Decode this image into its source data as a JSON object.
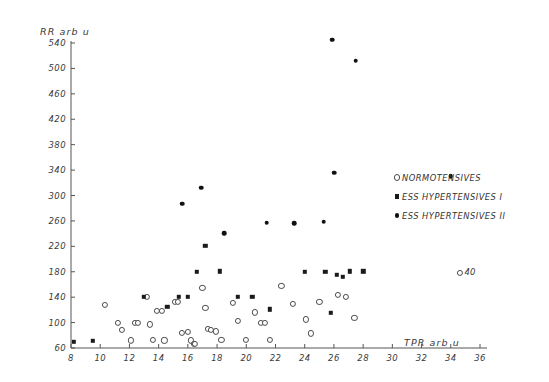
{
  "chart_data": {
    "type": "scatter",
    "title": "",
    "xlabel": "TPR arb u",
    "ylabel": "RR arb u",
    "xlim": [
      8,
      36
    ],
    "ylim": [
      60,
      540
    ],
    "xticks": [
      8,
      10,
      12,
      14,
      16,
      18,
      20,
      22,
      24,
      26,
      28,
      30,
      32,
      34,
      36
    ],
    "yticks": [
      60,
      100,
      140,
      180,
      220,
      260,
      300,
      340,
      380,
      420,
      460,
      500,
      540
    ],
    "grid": false,
    "legend_position": "right",
    "series": [
      {
        "name": "NORMOTENSIVES",
        "marker": "open-circle",
        "color": "#4a4a4a",
        "points": [
          [
            10.3,
            128
          ],
          [
            11.2,
            100
          ],
          [
            11.5,
            88
          ],
          [
            12.1,
            72
          ],
          [
            12.4,
            100
          ],
          [
            12.6,
            100
          ],
          [
            13.2,
            140
          ],
          [
            13.4,
            97
          ],
          [
            13.6,
            73
          ],
          [
            13.9,
            119
          ],
          [
            14.2,
            119
          ],
          [
            14.4,
            72
          ],
          [
            15.1,
            132
          ],
          [
            15.3,
            132
          ],
          [
            15.6,
            84
          ],
          [
            16.0,
            85
          ],
          [
            16.2,
            72
          ],
          [
            16.4,
            66
          ],
          [
            16.5,
            66
          ],
          [
            17.0,
            155
          ],
          [
            17.2,
            123
          ],
          [
            17.4,
            90
          ],
          [
            17.6,
            88
          ],
          [
            17.9,
            86
          ],
          [
            18.3,
            73
          ],
          [
            19.1,
            131
          ],
          [
            19.4,
            103
          ],
          [
            20.0,
            73
          ],
          [
            20.6,
            116
          ],
          [
            21.0,
            99
          ],
          [
            21.3,
            99
          ],
          [
            21.6,
            73
          ],
          [
            22.4,
            158
          ],
          [
            23.2,
            129
          ],
          [
            24.1,
            105
          ],
          [
            24.4,
            83
          ],
          [
            25.0,
            132
          ],
          [
            26.3,
            143
          ],
          [
            26.8,
            140
          ],
          [
            27.4,
            107
          ],
          [
            34.6,
            178
          ]
        ]
      },
      {
        "name": "ESS HYPERTENSIVES I",
        "marker": "filled-square",
        "color": "#1a1a1a",
        "points": [
          [
            8.2,
            70
          ],
          [
            9.5,
            71
          ],
          [
            13.0,
            141
          ],
          [
            14.6,
            125
          ],
          [
            15.4,
            141
          ],
          [
            16.0,
            141
          ],
          [
            16.6,
            180
          ],
          [
            17.2,
            221
          ],
          [
            18.2,
            181
          ],
          [
            19.4,
            141
          ],
          [
            20.4,
            141
          ],
          [
            21.6,
            121
          ],
          [
            24.0,
            180
          ],
          [
            25.4,
            180
          ],
          [
            26.2,
            175
          ],
          [
            26.6,
            172
          ],
          [
            27.1,
            181
          ],
          [
            28.0,
            181
          ],
          [
            25.8,
            115
          ]
        ]
      },
      {
        "name": "ESS HYPERTENSIVES II",
        "marker": "filled-circle",
        "color": "#111111",
        "points": [
          [
            15.6,
            287
          ],
          [
            16.9,
            312
          ],
          [
            18.5,
            241
          ],
          [
            21.4,
            257
          ],
          [
            23.3,
            256
          ],
          [
            25.3,
            259
          ],
          [
            25.9,
            545
          ],
          [
            26.0,
            336
          ],
          [
            27.5,
            512
          ],
          [
            34.0,
            330
          ]
        ]
      }
    ],
    "annotations": [
      {
        "text": "40",
        "x": 34.6,
        "y": 178,
        "marker": "open-circle"
      }
    ]
  },
  "legend": {
    "items": [
      {
        "label": "NORMOTENSIVES",
        "marker": "open"
      },
      {
        "label": "ESS HYPERTENSIVES I",
        "marker": "sq"
      },
      {
        "label": "ESS HYPERTENSIVES II",
        "marker": "dot"
      }
    ]
  }
}
